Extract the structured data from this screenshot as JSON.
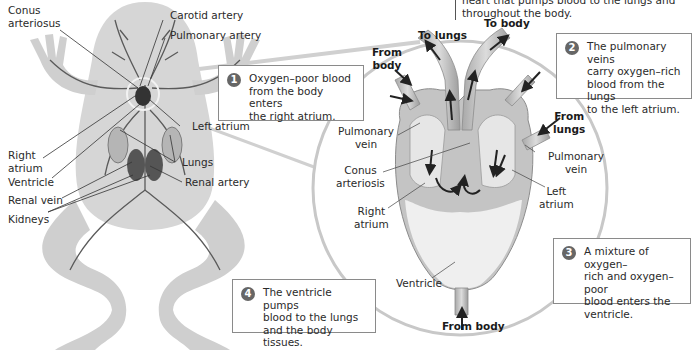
{
  "top_note": {
    "line1": "heart that pumps blood to the lungs and",
    "line2": "throughout the body."
  },
  "frog_labels": {
    "conus_arteriosus_1": "Conus",
    "conus_arteriosus_2": "arteriosus",
    "carotid_artery": "Carotid artery",
    "pulmonary_artery": "Pulmonary artery",
    "right_atrium_1": "Right",
    "right_atrium_2": "atrium",
    "ventricle": "Ventricle",
    "renal_vein": "Renal vein",
    "kidneys": "Kidneys",
    "left_atrium": "Left atrium",
    "lungs": "Lungs",
    "renal_artery": "Renal artery"
  },
  "heart_labels": {
    "to_lungs": "To lungs",
    "to_body": "To body",
    "from_body_top_1": "From",
    "from_body_top_2": "body",
    "from_lungs_1": "From",
    "from_lungs_2": "lungs",
    "pulmonary_vein_left_1": "Pulmonary",
    "pulmonary_vein_left_2": "vein",
    "pulmonary_vein_right_1": "Pulmonary",
    "pulmonary_vein_right_2": "vein",
    "conus_arteriosis_1": "Conus",
    "conus_arteriosis_2": "arteriosis",
    "right_atrium_1": "Right",
    "right_atrium_2": "atrium",
    "left_atrium_1": "Left",
    "left_atrium_2": "atrium",
    "ventricle": "Ventricle",
    "from_body_bottom": "From body"
  },
  "steps": [
    {
      "number": "1",
      "lines": [
        "Oxygen–poor blood",
        "from the body enters",
        "the right atrium."
      ]
    },
    {
      "number": "2",
      "lines": [
        "The pulmonary veins",
        "carry oxygen–rich",
        "blood from the lungs",
        "to the left atrium."
      ]
    },
    {
      "number": "3",
      "lines": [
        "A mixture of oxygen–",
        "rich and oxygen–poor",
        "blood enters the",
        "ventricle."
      ]
    },
    {
      "number": "4",
      "lines": [
        "The ventricle pumps",
        "blood to the lungs",
        "and the body tissues."
      ]
    }
  ],
  "colors": {
    "badge": "#666666",
    "frog_body": "#d4d4d4",
    "vessel": "#555555",
    "heart_wall": "#bdbdbd",
    "ventricle_fill": "#eeeeee",
    "callout_circle": "#c8c8c8"
  }
}
